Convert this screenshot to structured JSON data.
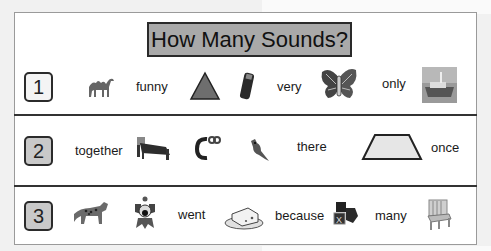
{
  "title": "How Many Sounds?",
  "rows": [
    {
      "number": "1",
      "items": [
        {
          "type": "picture",
          "icon": "camel-icon"
        },
        {
          "type": "word",
          "text": "funny"
        },
        {
          "type": "picture",
          "icon": "triangle-icon"
        },
        {
          "type": "picture",
          "icon": "battery-icon"
        },
        {
          "type": "word",
          "text": "very"
        },
        {
          "type": "picture",
          "icon": "butterfly-icon"
        },
        {
          "type": "word",
          "text": "only"
        },
        {
          "type": "picture",
          "icon": "boat-icon"
        }
      ]
    },
    {
      "number": "2",
      "items": [
        {
          "type": "word",
          "text": "together"
        },
        {
          "type": "picture",
          "icon": "bed-icon"
        },
        {
          "type": "picture",
          "icon": "letter-c-icon"
        },
        {
          "type": "picture",
          "icon": "cardinal-bird-icon"
        },
        {
          "type": "word",
          "text": "there"
        },
        {
          "type": "picture",
          "icon": "trapezoid-icon"
        },
        {
          "type": "word",
          "text": "once"
        }
      ]
    },
    {
      "number": "3",
      "items": [
        {
          "type": "picture",
          "icon": "leopard-icon"
        },
        {
          "type": "picture",
          "icon": "clown-icon"
        },
        {
          "type": "word",
          "text": "went"
        },
        {
          "type": "picture",
          "icon": "cheese-icon"
        },
        {
          "type": "word",
          "text": "because"
        },
        {
          "type": "picture",
          "icon": "blocks-icon"
        },
        {
          "type": "word",
          "text": "many"
        },
        {
          "type": "picture",
          "icon": "chair-icon"
        }
      ]
    }
  ],
  "colors": {
    "title_box_bg": "#a9a9a9",
    "number_box_shaded": "#c9c9c9",
    "border": "#2b2b2b"
  }
}
